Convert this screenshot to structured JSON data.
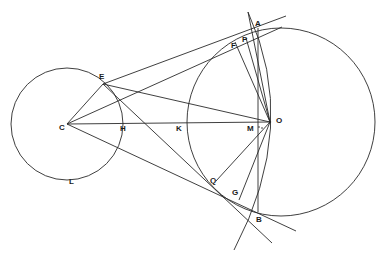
{
  "figure": {
    "type": "geometric construction",
    "stroke_color": "#2a2a2a",
    "background": "#ffffff",
    "points": {
      "A": {
        "label": "A",
        "x": 258,
        "y": 30
      },
      "B": {
        "label": "B",
        "x": 258,
        "y": 211
      },
      "C": {
        "label": "C",
        "x": 67,
        "y": 124
      },
      "E": {
        "label": "E",
        "x": 103,
        "y": 84
      },
      "F": {
        "label": "F",
        "x": 235,
        "y": 40
      },
      "P": {
        "label": "P",
        "x": 246,
        "y": 37
      },
      "G": {
        "label": "G",
        "x": 238,
        "y": 199
      },
      "Q": {
        "label": "Q",
        "x": 213,
        "y": 185
      },
      "H": {
        "label": "H",
        "x": 123,
        "y": 124
      },
      "K": {
        "label": "K",
        "x": 186,
        "y": 124
      },
      "M": {
        "label": "M",
        "x": 258,
        "y": 124
      },
      "O": {
        "label": "O",
        "x": 270,
        "y": 122
      },
      "L": {
        "label": "L",
        "x": 72,
        "y": 180
      }
    },
    "circles": [
      {
        "name": "small-circle",
        "cx": 67,
        "cy": 124,
        "r": 56
      },
      {
        "name": "large-circle",
        "cx": 281,
        "cy": 122,
        "r": 94
      }
    ]
  }
}
